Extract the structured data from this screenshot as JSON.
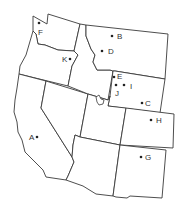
{
  "map": {
    "region": "Western United States",
    "states": [
      {
        "id": "washington"
      },
      {
        "id": "oregon"
      },
      {
        "id": "california"
      },
      {
        "id": "nevada"
      },
      {
        "id": "idaho"
      },
      {
        "id": "montana"
      },
      {
        "id": "wyoming"
      },
      {
        "id": "utah"
      },
      {
        "id": "colorado"
      },
      {
        "id": "arizona"
      },
      {
        "id": "new-mexico"
      }
    ],
    "points": [
      {
        "label": "A",
        "x": 37,
        "y": 137,
        "lx": 29,
        "ly": 140
      },
      {
        "label": "B",
        "x": 112,
        "y": 36,
        "lx": 117,
        "ly": 39
      },
      {
        "label": "C",
        "x": 142,
        "y": 103,
        "lx": 145,
        "ly": 106
      },
      {
        "label": "D",
        "x": 102,
        "y": 51,
        "lx": 108,
        "ly": 54
      },
      {
        "label": "E",
        "x": 114,
        "y": 77,
        "lx": 117,
        "ly": 79
      },
      {
        "label": "F",
        "x": 39,
        "y": 23,
        "lx": 38,
        "ly": 35
      },
      {
        "label": "G",
        "x": 141,
        "y": 157,
        "lx": 145,
        "ly": 160
      },
      {
        "label": "H",
        "x": 151,
        "y": 120,
        "lx": 156,
        "ly": 123
      },
      {
        "label": "I",
        "x": 124,
        "y": 85,
        "lx": 130,
        "ly": 89
      },
      {
        "label": "J",
        "x": 116,
        "y": 85,
        "lx": 115,
        "ly": 96
      },
      {
        "label": "K",
        "x": 70,
        "y": 59,
        "lx": 62,
        "ly": 62
      }
    ],
    "colors": {
      "background": "#ffffff",
      "border": "#3a3a3a",
      "dot": "#222222",
      "label": "#333333"
    }
  }
}
